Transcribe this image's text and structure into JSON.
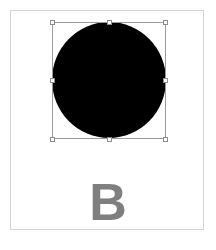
{
  "canvas": {
    "shape": {
      "type": "circle",
      "fill": "#000000",
      "selected": true
    },
    "selection": {
      "border_color": "#9a9a9a",
      "handles": [
        "top-left",
        "top-center",
        "top-right",
        "middle-left",
        "middle-right",
        "bottom-left",
        "bottom-center",
        "bottom-right"
      ]
    },
    "label": {
      "text": "B",
      "color": "#7f7f7f"
    }
  }
}
